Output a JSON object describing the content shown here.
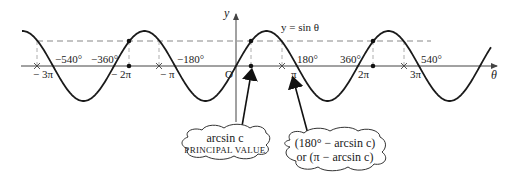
{
  "diagram": {
    "title": "y = sin θ",
    "axes": {
      "x_label": "θ",
      "y_label": "y",
      "origin_label": "O"
    },
    "curve_label": "y = sin θ",
    "degree_ticks": [
      "−540°",
      "−360°",
      "−180°",
      "180°",
      "360°",
      "540°"
    ],
    "radian_ticks": [
      "− 3π",
      "− 2π",
      "− π",
      "π",
      "2π",
      "3π"
    ],
    "horizontal_line": "y = c (dashed)",
    "callouts": {
      "principal": {
        "line1": "arcsin c",
        "line2": "PRINCIPAL VALUE"
      },
      "secondary": {
        "line1": "(180° − arcsin c)",
        "line2": "or (π − arcsin c)"
      }
    },
    "colors": {
      "curve": "#1a1a1a",
      "axis": "#444444",
      "dashed": "#888888",
      "text": "#222222"
    }
  },
  "chart_data": {
    "type": "line",
    "title": "y = sin θ",
    "xlabel": "θ",
    "ylabel": "y",
    "x_ticks_degrees": [
      -540,
      -360,
      -180,
      0,
      180,
      360,
      540
    ],
    "x_ticks_radians": [
      "-3π",
      "-2π",
      "-π",
      "0",
      "π",
      "2π",
      "3π"
    ],
    "x_range_degrees": [
      -632,
      752
    ],
    "ylim": [
      -1,
      1
    ],
    "series": [
      {
        "name": "y = sin θ",
        "function": "sin(θ)"
      },
      {
        "name": "y = c",
        "value": 0.71,
        "style": "dashed"
      }
    ],
    "solution_points_degrees": {
      "arcsin_c_family": [
        -674.5,
        -314.5,
        45.5,
        405.5
      ],
      "pi_minus_arcsin_c_family": [
        -585.5,
        -225.5,
        134.5,
        494.5
      ]
    },
    "annotations": [
      "arcsin c — PRINCIPAL VALUE",
      "(180° − arcsin c) or (π − arcsin c)"
    ]
  }
}
